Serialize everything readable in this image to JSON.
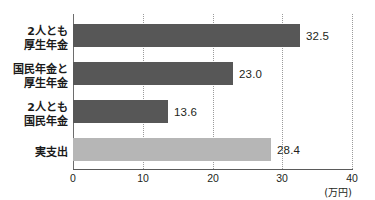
{
  "chart_data": {
    "type": "bar",
    "orientation": "horizontal",
    "title": "",
    "xlabel": "(万円)",
    "ylabel": "",
    "xlim": [
      0,
      40
    ],
    "xticks": [
      "0",
      "10",
      "20",
      "30",
      "40"
    ],
    "grid": true,
    "legend": "none",
    "categories": [
      "2人とも\n厚生年金",
      "国民年金と\n厚生年金",
      "2人とも\n国民年金",
      "実支出"
    ],
    "values": [
      32.5,
      23.0,
      13.6,
      28.4
    ],
    "value_labels": [
      "32.5",
      "23.0",
      "13.6",
      "28.4"
    ],
    "bar_colors": [
      "#575757",
      "#575757",
      "#575757",
      "#b6b6b6"
    ]
  },
  "axis": {
    "unit": "(万円)",
    "origin_label": "0"
  },
  "colors": {
    "bar_dark": "#575757",
    "bar_light": "#b6b6b6",
    "gridline": "#9b9b9b",
    "axis": "#5a5a5a",
    "text": "#231f20",
    "background": "#ffffff"
  }
}
